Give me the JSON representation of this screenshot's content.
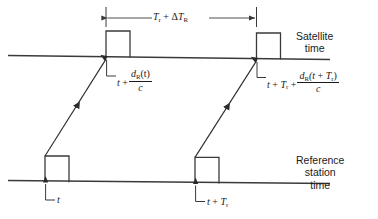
{
  "figure": {
    "colors": {
      "line": "#3a3a3a",
      "text": "#1a1a1a",
      "background": "#ffffff"
    }
  },
  "timelines": [
    {
      "id": "satellite",
      "label_lines": [
        "Satellite",
        "time"
      ],
      "label_text": "Satellite time"
    },
    {
      "id": "reference-station",
      "label_lines": [
        "Reference",
        "station",
        "time"
      ],
      "label_text": "Reference station time"
    }
  ],
  "dimension": {
    "text": "T_r + ΔT_R",
    "parts": {
      "first_symbol": "T",
      "first_subscript": "r",
      "operator": "+",
      "delta": "Δ",
      "second_symbol": "T",
      "second_subscript": "R"
    }
  },
  "annotations": {
    "satellite_pulse_1": {
      "text": "t + d_R(t)/c",
      "parts": {
        "lead": "t",
        "operator": "+",
        "numerator_symbol": "d",
        "numerator_subscript": "R",
        "numerator_arg": "(t)",
        "denominator": "c"
      }
    },
    "satellite_pulse_2": {
      "text": "t + T_r + d_R(t + T_r)/c",
      "parts": {
        "lead": "t",
        "operator_1": "+",
        "term_symbol": "T",
        "term_subscript": "r",
        "operator_2": "+",
        "numerator_symbol": "d",
        "numerator_subscript": "R",
        "numerator_arg_lead": "(t",
        "numerator_arg_op": "+",
        "numerator_arg_symbol": "T",
        "numerator_arg_subscript": "r",
        "numerator_arg_close": ")",
        "denominator": "c"
      }
    },
    "reference_pulse_1": {
      "text": "t",
      "parts": {
        "lead": "t"
      }
    },
    "reference_pulse_2": {
      "text": "t + T_r",
      "parts": {
        "lead": "t",
        "operator": "+",
        "term_symbol": "T",
        "term_subscript": "r"
      }
    }
  }
}
